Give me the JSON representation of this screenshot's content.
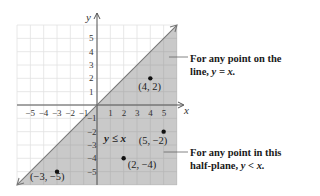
{
  "chart_data": {
    "type": "inequality-graph",
    "title": "",
    "xlabel": "x",
    "ylabel": "y",
    "xlim": [
      -6,
      6
    ],
    "ylim": [
      -6,
      6
    ],
    "grid": true,
    "x_ticks": [
      "-5",
      "-4",
      "-3",
      "-2",
      "-1",
      "1",
      "2",
      "3",
      "4",
      "5"
    ],
    "y_ticks": [
      "5",
      "4",
      "3",
      "2",
      "1",
      "-1",
      "-2",
      "-3",
      "-4",
      "-5"
    ],
    "boundary_line": "y = x",
    "shaded_region": "y ≤ x (below the line)",
    "inequality_label": "y ≤ x",
    "points": [
      {
        "label": "(4, 2)",
        "x": 4,
        "y": 2
      },
      {
        "label": "(5, −2)",
        "x": 5,
        "y": -2
      },
      {
        "label": "(2, −4)",
        "x": 2,
        "y": -4
      },
      {
        "label": "(−3, −5)",
        "x": -3,
        "y": -5
      }
    ],
    "annotations": [
      {
        "text": "For any point on the line, y = x.",
        "points_to": "boundary line"
      },
      {
        "text": "For any point in this half-plane, y < x.",
        "points_to": "shaded region"
      }
    ],
    "colors": {
      "shade": "#c9c9c9",
      "grid_light": "#e2e2e2",
      "grid_shaded": "#b7b7b7",
      "axis": "#555555",
      "point": "#111111"
    }
  },
  "labels": {
    "x_axis": "x",
    "y_axis": "y",
    "inequality": "y ≤ x",
    "note1_line1": "For any point on the",
    "note1_line2_pre": "line, ",
    "note1_line2_math": "y = x.",
    "note2_line1": "For any point in this",
    "note2_line2_pre": "half-plane, ",
    "note2_line2_math": "y < x."
  }
}
